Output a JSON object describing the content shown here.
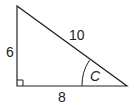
{
  "diagram": {
    "type": "right-triangle",
    "sides": {
      "vertical_leg": "6",
      "hypotenuse": "10",
      "horizontal_leg": "8"
    },
    "angle_label": "C",
    "right_angle_marker": true,
    "colors": {
      "stroke": "#222222",
      "background": "#ffffff"
    }
  }
}
